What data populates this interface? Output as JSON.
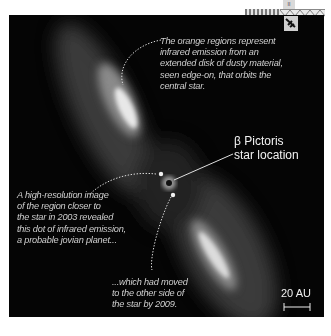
{
  "figure": {
    "annotations": [
      {
        "id": "disk",
        "lines": [
          "The orange regions represent",
          "infrared emission from an",
          "extended disk of dusty material,",
          "seen edge-on, that orbits the",
          "central star."
        ]
      },
      {
        "id": "planet_2003",
        "lines": [
          "A high-resolution image",
          "of the region closer to",
          "the star in 2003 revealed",
          "this dot of infrared emission,",
          "a probable jovian planet..."
        ]
      },
      {
        "id": "planet_2009",
        "lines": [
          "...which had moved",
          "to the other side of",
          "the star by 2009."
        ]
      }
    ],
    "star_label": {
      "symbol": "β",
      "line1": "Pictoris",
      "line2": "star location"
    },
    "scale_bar": {
      "label": "20 AU"
    }
  }
}
